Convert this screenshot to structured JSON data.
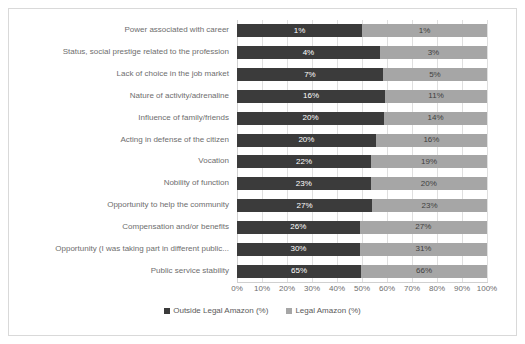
{
  "chart_data": {
    "type": "bar",
    "subtype": "100% stacked horizontal bar",
    "title": "",
    "xlabel": "",
    "ylabel": "",
    "xlim": [
      0,
      100
    ],
    "grid": true,
    "legend_position": "bottom-center",
    "x_ticks": [
      "0%",
      "10%",
      "20%",
      "30%",
      "40%",
      "50%",
      "60%",
      "70%",
      "80%",
      "90%",
      "100%"
    ],
    "categories": [
      "Power associated with career",
      "Status, social prestige related to the profession",
      "Lack of choice in the job market",
      "Nature of activity/adrenaline",
      "Influence of family/friends",
      "Acting in defense of the citizen",
      "Vocation",
      "Nobility of function",
      "Opportunity to help the community",
      "Compensation and/or benefits",
      "Opportunity (I was taking part in different public...",
      "Public service stability"
    ],
    "series": [
      {
        "name": "Outside Legal Amazon (%)",
        "color": "#3b3b3b",
        "values": [
          1,
          4,
          7,
          16,
          20,
          20,
          22,
          23,
          27,
          26,
          30,
          65
        ],
        "labels": [
          "1%",
          "4%",
          "7%",
          "16%",
          "20%",
          "20%",
          "22%",
          "23%",
          "27%",
          "26%",
          "30%",
          "65%"
        ]
      },
      {
        "name": "Legal Amazon (%)",
        "color": "#a6a6a6",
        "values": [
          1,
          3,
          5,
          11,
          14,
          16,
          19,
          20,
          23,
          27,
          31,
          66
        ],
        "labels": [
          "1%",
          "3%",
          "5%",
          "11%",
          "14%",
          "16%",
          "19%",
          "20%",
          "23%",
          "27%",
          "31%",
          "66%"
        ]
      }
    ]
  },
  "legend": {
    "items": [
      {
        "label": "Outside Legal Amazon (%)",
        "color": "#3b3b3b"
      },
      {
        "label": "Legal Amazon (%)",
        "color": "#a6a6a6"
      }
    ]
  },
  "colors": {
    "series_dark": "#3b3b3b",
    "series_light": "#a6a6a6",
    "grid": "#dfdfdf",
    "axis_text": "#6e6e6e",
    "frame_border": "#d9d9d9",
    "background": "#ffffff"
  }
}
